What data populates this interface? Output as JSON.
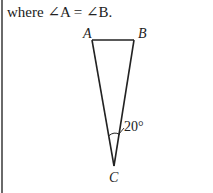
{
  "problem": {
    "cut_off_text": "",
    "statement_prefix": "where ",
    "angle_symbol": "∠",
    "statement": "where ∠A = ∠B."
  },
  "figure": {
    "type": "isosceles-triangle",
    "vertices": {
      "A": {
        "label": "A"
      },
      "B": {
        "label": "B"
      },
      "C": {
        "label": "C"
      }
    },
    "apex_angle_label": "20°",
    "line_color": "#222222"
  }
}
